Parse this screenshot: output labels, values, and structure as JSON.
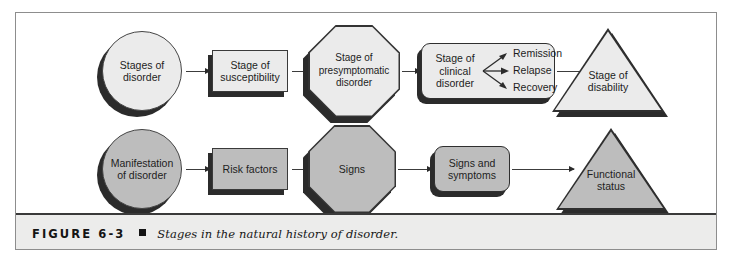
{
  "figure": {
    "number_label": "FIGURE 6-3",
    "bullet": "square-bullet",
    "caption": "Stages in the natural history of disorder."
  },
  "colors": {
    "top_row_fill": "#ebebeb",
    "bottom_row_fill": "#bdbdbd",
    "shape_outline": "#333333",
    "shadow": "#2b2b2b",
    "connector": "#3c3c3c",
    "frame_border": "#8d8d8d",
    "caption_band": "#ececeb",
    "page_background": "#ffffff"
  },
  "diagram": {
    "title": "Stages in the natural history of disorder",
    "type": "flowchart",
    "rows": [
      {
        "name": "stages-row",
        "fill": "#ebebeb",
        "nodes": [
          {
            "id": "stages-of-disorder",
            "shape": "circle",
            "label": "Stages of\ndisorder"
          },
          {
            "id": "stage-of-susceptibility",
            "shape": "rectangle",
            "label": "Stage of\nsusceptibility"
          },
          {
            "id": "stage-of-presymptomatic-disorder",
            "shape": "octagon",
            "label": "Stage of\npresymptomatic\ndisorder"
          },
          {
            "id": "stage-of-clinical-disorder",
            "shape": "rounded-rectangle",
            "label": "Stage of\nclinical\ndisorder"
          },
          {
            "id": "stage-of-disability",
            "shape": "triangle",
            "label": "Stage of\ndisability"
          }
        ],
        "branches": [
          {
            "id": "branch-remission",
            "label": "Remission"
          },
          {
            "id": "branch-relapse",
            "label": "Relapse"
          },
          {
            "id": "branch-recovery",
            "label": "Recovery"
          }
        ]
      },
      {
        "name": "manifestation-row",
        "fill": "#bdbdbd",
        "nodes": [
          {
            "id": "manifestation-of-disorder",
            "shape": "circle",
            "label": "Manifestation\nof disorder"
          },
          {
            "id": "risk-factors",
            "shape": "rectangle",
            "label": "Risk factors"
          },
          {
            "id": "signs",
            "shape": "octagon",
            "label": "Signs"
          },
          {
            "id": "signs-and-symptoms",
            "shape": "rounded-rectangle",
            "label": "Signs and\nsymptoms"
          },
          {
            "id": "functional-status",
            "shape": "triangle",
            "label": "Functional\nstatus"
          }
        ]
      }
    ]
  }
}
